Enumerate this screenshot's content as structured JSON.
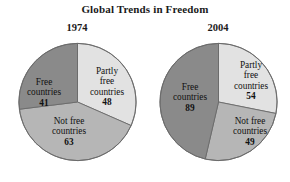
{
  "chart_data": {
    "type": "pie",
    "title": "Global Trends in Freedom",
    "xlabel": "",
    "ylabel": "",
    "legend": "none",
    "grid": false,
    "charts": [
      {
        "panel_title": "1974",
        "categories": [
          "Partly free countries",
          "Not free countries",
          "Free countries"
        ],
        "values": [
          48,
          63,
          41
        ],
        "total": 152,
        "slices": [
          {
            "label": "Partly free countries",
            "value": 48,
            "color": "#e2e2e2",
            "start_deg": 0,
            "end_deg": 113.7
          },
          {
            "label": "Not free countries",
            "value": 63,
            "color": "#b6b6b6",
            "start_deg": 113.7,
            "end_deg": 262.9
          },
          {
            "label": "Free countries",
            "value": 41,
            "color": "#8a8a8a",
            "start_deg": 262.9,
            "end_deg": 360
          }
        ]
      },
      {
        "panel_title": "2004",
        "categories": [
          "Partly free countries",
          "Not free countries",
          "Free countries"
        ],
        "values": [
          54,
          49,
          89
        ],
        "total": 192,
        "slices": [
          {
            "label": "Partly free countries",
            "value": 54,
            "color": "#e2e2e2",
            "start_deg": 0,
            "end_deg": 101.3
          },
          {
            "label": "Not free countries",
            "value": 49,
            "color": "#b6b6b6",
            "start_deg": 101.3,
            "end_deg": 193.1
          },
          {
            "label": "Free countries",
            "value": 89,
            "color": "#8a8a8a",
            "start_deg": 193.1,
            "end_deg": 360
          }
        ]
      }
    ]
  },
  "title": "Global Trends in Freedom",
  "pie_1974": {
    "year": "1974",
    "free": {
      "name_line1": "Free",
      "name_line2": "countries",
      "value": "41"
    },
    "partly_free": {
      "name_line1": "Partly",
      "name_line2": "free",
      "name_line3": "countries",
      "value": "48"
    },
    "not_free": {
      "name_line1": "Not free",
      "name_line2": "countries",
      "value": "63"
    }
  },
  "pie_2004": {
    "year": "2004",
    "free": {
      "name_line1": "Free",
      "name_line2": "countries",
      "value": "89"
    },
    "partly_free": {
      "name_line1": "Partly",
      "name_line2": "free",
      "name_line3": "countries",
      "value": "54"
    },
    "not_free": {
      "name_line1": "Not free",
      "name_line2": "countries",
      "value": "49"
    }
  },
  "colors": {
    "free_slice": "#8a8a8a",
    "partly_free_slice": "#e2e2e2",
    "not_free_slice": "#b6b6b6",
    "outline": "#6a6a6a",
    "text": "#111111",
    "background": "#ffffff"
  }
}
